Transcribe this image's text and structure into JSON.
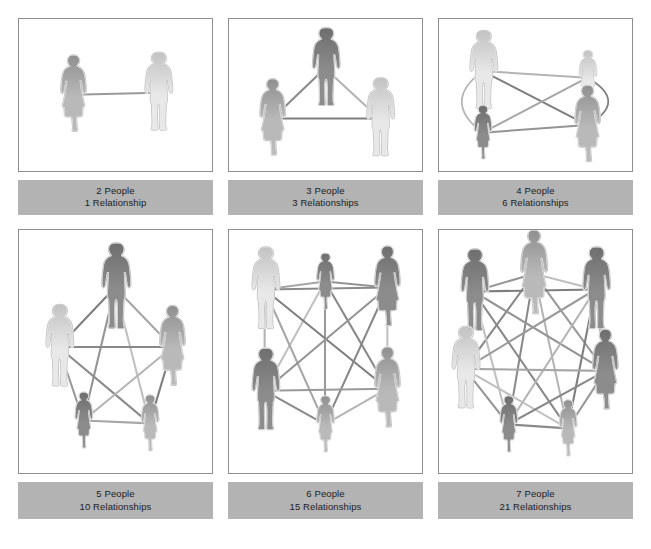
{
  "figure": {
    "background_color": "#ffffff",
    "panel_border_color": "#8e8e8e",
    "caption_band_color": "#b3b3b3",
    "caption_text_color": "#1c1c1c"
  },
  "chart_data": {
    "type": "diagram",
    "formula": "n(n-1)/2",
    "categories": [
      "2 People",
      "3 People",
      "4 People",
      "5 People",
      "6 People",
      "7 People"
    ],
    "people": [
      2,
      3,
      4,
      5,
      6,
      7
    ],
    "relationships": [
      1,
      3,
      6,
      10,
      15,
      21
    ],
    "xlabel": "Number of people",
    "ylabel": "Number of relationships",
    "legend": [],
    "grid": false
  },
  "panels": [
    {
      "id": "panel-2-people",
      "people_label": "2 People",
      "relationships_label": "1 Relationship",
      "people": 2,
      "relationships": 1,
      "nodes": [
        {
          "name": "woman-standing",
          "x": 55,
          "y": 80,
          "type": "woman",
          "scale": 1.0,
          "tone": "mid"
        },
        {
          "name": "man-standing",
          "x": 140,
          "y": 78,
          "type": "man",
          "scale": 1.0,
          "tone": "light"
        }
      ],
      "edges": [
        [
          0,
          1
        ]
      ]
    },
    {
      "id": "panel-3-people",
      "people_label": "3 People",
      "relationships_label": "3 Relationships",
      "people": 3,
      "relationships": 3,
      "nodes": [
        {
          "name": "man-top",
          "x": 97,
          "y": 52,
          "type": "man",
          "scale": 1.0,
          "tone": "dark"
        },
        {
          "name": "woman-left",
          "x": 44,
          "y": 105,
          "type": "woman",
          "scale": 1.0,
          "tone": "mid"
        },
        {
          "name": "man-right",
          "x": 152,
          "y": 105,
          "type": "man",
          "scale": 1.0,
          "tone": "light"
        }
      ],
      "edges": [
        [
          0,
          1
        ],
        [
          0,
          2
        ],
        [
          1,
          2
        ]
      ]
    },
    {
      "id": "panel-4-people",
      "people_label": "4 People",
      "relationships_label": "6 Relationships",
      "people": 4,
      "relationships": 6,
      "nodes": [
        {
          "name": "man-top-left",
          "x": 44,
          "y": 55,
          "type": "man",
          "scale": 1.0,
          "tone": "light"
        },
        {
          "name": "child-top-right",
          "x": 150,
          "y": 62,
          "type": "child",
          "scale": 1.0,
          "tone": "light"
        },
        {
          "name": "child-bottom-left",
          "x": 44,
          "y": 120,
          "type": "child",
          "scale": 1.0,
          "tone": "dark"
        },
        {
          "name": "woman-bottom-right",
          "x": 150,
          "y": 112,
          "type": "woman",
          "scale": 1.0,
          "tone": "mid"
        }
      ],
      "edges": [
        [
          0,
          1
        ],
        [
          0,
          3
        ],
        [
          1,
          2
        ],
        [
          2,
          3
        ]
      ],
      "arc_edges": [
        [
          0,
          2
        ],
        [
          1,
          3
        ]
      ]
    },
    {
      "id": "panel-5-people",
      "people_label": "5 People",
      "relationships_label": "10 Relationships",
      "people": 5,
      "relationships": 10,
      "nodes": [
        {
          "name": "man-top",
          "x": 97,
          "y": 58,
          "type": "man",
          "scale": 1.05,
          "tone": "dark"
        },
        {
          "name": "man-left",
          "x": 40,
          "y": 118,
          "type": "man",
          "scale": 1.0,
          "tone": "light"
        },
        {
          "name": "woman-right",
          "x": 155,
          "y": 118,
          "type": "woman",
          "scale": 1.0,
          "tone": "mid"
        },
        {
          "name": "child-bottom-left",
          "x": 65,
          "y": 192,
          "type": "child",
          "scale": 1.0,
          "tone": "dark"
        },
        {
          "name": "child-bottom-right",
          "x": 132,
          "y": 195,
          "type": "child",
          "scale": 1.0,
          "tone": "mid"
        }
      ],
      "edges": [
        [
          0,
          1
        ],
        [
          0,
          2
        ],
        [
          0,
          3
        ],
        [
          0,
          4
        ],
        [
          1,
          2
        ],
        [
          1,
          3
        ],
        [
          1,
          4
        ],
        [
          2,
          3
        ],
        [
          2,
          4
        ],
        [
          3,
          4
        ]
      ]
    },
    {
      "id": "panel-6-people",
      "people_label": "6 People",
      "relationships_label": "15 Relationships",
      "people": 6,
      "relationships": 15,
      "nodes": [
        {
          "name": "child-top-center",
          "x": 97,
          "y": 52,
          "type": "child",
          "scale": 1.0,
          "tone": "dark"
        },
        {
          "name": "man-top-left",
          "x": 36,
          "y": 60,
          "type": "man",
          "scale": 1.0,
          "tone": "light"
        },
        {
          "name": "woman-top-right",
          "x": 160,
          "y": 58,
          "type": "woman",
          "scale": 1.0,
          "tone": "dark"
        },
        {
          "name": "man-bottom-left",
          "x": 36,
          "y": 162,
          "type": "man",
          "scale": 1.0,
          "tone": "dark"
        },
        {
          "name": "woman-bottom-right",
          "x": 160,
          "y": 160,
          "type": "woman",
          "scale": 1.0,
          "tone": "mid"
        },
        {
          "name": "child-bottom-center",
          "x": 97,
          "y": 196,
          "type": "child",
          "scale": 1.0,
          "tone": "mid"
        }
      ],
      "edges": [
        [
          0,
          1
        ],
        [
          0,
          2
        ],
        [
          0,
          3
        ],
        [
          0,
          4
        ],
        [
          0,
          5
        ],
        [
          1,
          2
        ],
        [
          1,
          3
        ],
        [
          1,
          4
        ],
        [
          1,
          5
        ],
        [
          2,
          3
        ],
        [
          2,
          4
        ],
        [
          2,
          5
        ],
        [
          3,
          4
        ],
        [
          3,
          5
        ],
        [
          4,
          5
        ]
      ]
    },
    {
      "id": "panel-7-people",
      "people_label": "7 People",
      "relationships_label": "21 Relationships",
      "people": 7,
      "relationships": 21,
      "nodes": [
        {
          "name": "woman-top-center",
          "x": 96,
          "y": 44,
          "type": "woman",
          "scale": 1.05,
          "tone": "mid"
        },
        {
          "name": "man-top-left",
          "x": 35,
          "y": 62,
          "type": "man",
          "scale": 1.0,
          "tone": "dark"
        },
        {
          "name": "man-top-right",
          "x": 158,
          "y": 60,
          "type": "man",
          "scale": 1.0,
          "tone": "dark"
        },
        {
          "name": "man-mid-left",
          "x": 26,
          "y": 140,
          "type": "man",
          "scale": 1.0,
          "tone": "light"
        },
        {
          "name": "woman-mid-right",
          "x": 168,
          "y": 142,
          "type": "woman",
          "scale": 1.0,
          "tone": "dark"
        },
        {
          "name": "child-bottom-left",
          "x": 70,
          "y": 196,
          "type": "child",
          "scale": 1.0,
          "tone": "dark"
        },
        {
          "name": "child-bottom-right",
          "x": 130,
          "y": 200,
          "type": "child",
          "scale": 1.0,
          "tone": "mid"
        }
      ],
      "edges": [
        [
          0,
          1
        ],
        [
          0,
          2
        ],
        [
          0,
          3
        ],
        [
          0,
          4
        ],
        [
          0,
          5
        ],
        [
          0,
          6
        ],
        [
          1,
          2
        ],
        [
          1,
          3
        ],
        [
          1,
          4
        ],
        [
          1,
          5
        ],
        [
          1,
          6
        ],
        [
          2,
          3
        ],
        [
          2,
          4
        ],
        [
          2,
          5
        ],
        [
          2,
          6
        ],
        [
          3,
          4
        ],
        [
          3,
          5
        ],
        [
          3,
          6
        ],
        [
          4,
          5
        ],
        [
          4,
          6
        ],
        [
          5,
          6
        ]
      ]
    }
  ]
}
